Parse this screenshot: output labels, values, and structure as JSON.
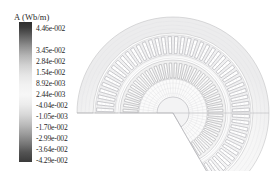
{
  "figure": {
    "kind": "fea-contour-plot",
    "background": "#ffffff"
  },
  "legend": {
    "title": "A (Wb/m)",
    "colormap": "grayscale",
    "dark_color": "#2e2e2e",
    "light_color": "#f7f7f7",
    "ticks": [
      "4.46e-002",
      "3.45e-002",
      "2.84e-002",
      "1.54e-002",
      "8.92e-003",
      "2.44e-003",
      "-4.04e-002",
      "-1.05e-003",
      "-1.70e-002",
      "-2.99e-002",
      "-3.64e-002",
      "-4.29e-002"
    ]
  },
  "chart_data": {
    "type": "heatmap",
    "title": "A (Wb/m)",
    "xlabel": "",
    "ylabel": "",
    "colorbar_label": "A (Wb/m)",
    "colorbar_ticks": [
      0.0446,
      0.0345,
      0.0284,
      0.0154,
      0.00892,
      0.00244,
      -0.0404,
      -0.00105,
      -0.017,
      -0.0299,
      -0.0364,
      -0.0429
    ],
    "colorbar_tick_labels": [
      "4.46e-002",
      "3.45e-002",
      "2.84e-002",
      "1.54e-002",
      "8.92e-003",
      "2.44e-003",
      "-4.04e-002",
      "-1.05e-003",
      "-1.70e-002",
      "-2.99e-002",
      "-3.64e-002",
      "-4.29e-002"
    ],
    "vmin": -0.0429,
    "vmax": 0.0446,
    "grid": false,
    "legend_position": "left",
    "geometry": {
      "shape": "annular-sector",
      "center_x": 173,
      "center_y": 113,
      "outer_radius": 96,
      "stator_yoke_outer_radius": 96,
      "stator_yoke_inner_radius": 80,
      "stator_slot_outer_radius": 78,
      "stator_slot_inner_radius": 58,
      "airgap_radius": 55,
      "rotor_outer_radius": 53,
      "rotor_bar_outer_radius": 51,
      "rotor_bar_inner_radius": 34,
      "shaft_radius": 16,
      "stator_slot_count": 48,
      "rotor_bar_count": 40,
      "sector_start_deg": 180,
      "sector_end_deg": 420
    }
  }
}
